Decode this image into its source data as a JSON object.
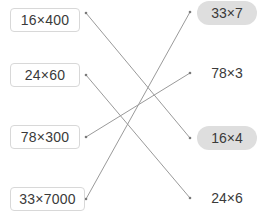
{
  "title": "",
  "left_items": [
    {
      "label": "16×400",
      "y": 8,
      "width": 70
    },
    {
      "label": "24×60",
      "y": 63,
      "width": 70
    },
    {
      "label": "78×300",
      "y": 125,
      "width": 70
    },
    {
      "label": "33×7000",
      "y": 187,
      "width": 75
    }
  ],
  "right_items": [
    {
      "label": "33×7",
      "style": "pill",
      "y": 1
    },
    {
      "label": "78×3",
      "style": "plain",
      "y": 61
    },
    {
      "label": "16×4",
      "style": "pill",
      "y": 126
    },
    {
      "label": "24×6",
      "style": "plain",
      "y": 186
    }
  ],
  "connections": [
    {
      "from": "16×400",
      "to": "16×4"
    },
    {
      "from": "24×60",
      "to": "24×6"
    },
    {
      "from": "78×300",
      "to": "78×3"
    },
    {
      "from": "33×7000",
      "to": "33×7"
    }
  ],
  "colors": {
    "line": "#9a9a9a",
    "pill_bg": "#dedede",
    "box_border": "#d8d8d8",
    "text": "#3a3a3a"
  }
}
